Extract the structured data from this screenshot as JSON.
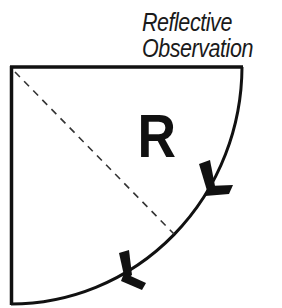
{
  "diagram": {
    "label": {
      "line1": "Reflective",
      "line2": "Observation"
    },
    "quadrant_letter": "R",
    "colors": {
      "stroke": "#111111",
      "dash": "#333333",
      "background": "#ffffff"
    }
  }
}
